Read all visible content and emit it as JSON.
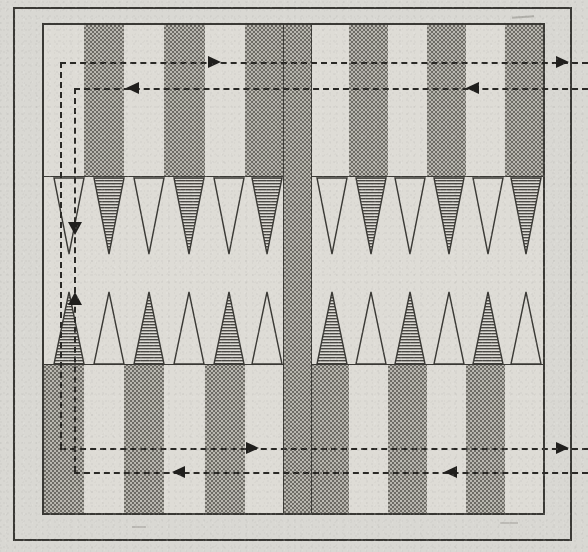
{
  "figure": {
    "kind": "backgammon-board-diagram",
    "background_color": "#d9d8d3",
    "board_color": "#dedcd6",
    "shade_color": "#6e6c66",
    "ink_color": "#3b3a36"
  },
  "geometry": {
    "canvas_width": 588,
    "canvas_height": 552,
    "outer_frame": {
      "x": 13,
      "y": 7,
      "width": 559,
      "height": 534
    },
    "board": {
      "x": 42,
      "y": 23,
      "width": 503,
      "height": 492
    },
    "bar": {
      "x": 281,
      "y": 23,
      "width": 27,
      "height": 492
    },
    "upper_quadrant": {
      "y": 23,
      "height": 152
    },
    "middle_band": {
      "y": 175,
      "height": 187
    },
    "lower_quadrant": {
      "y": 362,
      "height": 153
    },
    "point_count": 24,
    "points_per_quadrant": 6
  },
  "quadrants": [
    {
      "name": "top-left",
      "x": 42,
      "width": 239,
      "column_fills": [
        "light",
        "dark",
        "light",
        "dark",
        "light",
        "dark"
      ]
    },
    {
      "name": "top-right",
      "x": 308,
      "width": 237,
      "column_fills": [
        "light",
        "dark",
        "light",
        "dark",
        "light",
        "dark"
      ]
    },
    {
      "name": "bottom-left",
      "x": 42,
      "width": 239,
      "column_fills": [
        "dark",
        "light",
        "dark",
        "light",
        "dark",
        "light"
      ]
    },
    {
      "name": "bottom-right",
      "x": 308,
      "width": 237,
      "column_fills": [
        "dark",
        "light",
        "dark",
        "light",
        "dark",
        "light"
      ]
    }
  ],
  "points": {
    "top_left": {
      "direction": "down",
      "fills": [
        "open",
        "hatched",
        "open",
        "hatched",
        "open",
        "hatched"
      ]
    },
    "top_right": {
      "direction": "down",
      "fills": [
        "open",
        "hatched",
        "open",
        "hatched",
        "open",
        "hatched"
      ]
    },
    "bottom_left": {
      "direction": "up",
      "fills": [
        "hatched",
        "open",
        "hatched",
        "open",
        "hatched",
        "open"
      ]
    },
    "bottom_right": {
      "direction": "up",
      "fills": [
        "hatched",
        "open",
        "hatched",
        "open",
        "hatched",
        "open"
      ]
    }
  },
  "routes": [
    {
      "id": "route-player-one",
      "label": "Player one movement path",
      "style": "dashed",
      "segments": [
        {
          "type": "h",
          "x1": 60,
          "x2": 588,
          "y": 62,
          "arrow": "right",
          "arrow_x": 214
        },
        {
          "type": "h",
          "x1": 540,
          "x2": 588,
          "y": 62,
          "arrow": "right",
          "arrow_x": 560
        },
        {
          "type": "v",
          "x": 60,
          "y1": 62,
          "y2": 468
        },
        {
          "type": "h",
          "x1": 60,
          "x2": 588,
          "y": 448,
          "arrow": "right",
          "arrow_x": 252
        },
        {
          "type": "h",
          "x1": 500,
          "x2": 588,
          "y": 448,
          "arrow": "right",
          "arrow_x": 560
        }
      ]
    },
    {
      "id": "route-player-two",
      "label": "Player two movement path",
      "style": "dashed",
      "segments": [
        {
          "type": "h",
          "x1": 74,
          "x2": 588,
          "y": 88,
          "arrow": "left",
          "arrow_x": 132
        },
        {
          "type": "h",
          "x1": 440,
          "x2": 540,
          "y": 88,
          "arrow": "left",
          "arrow_x": 472
        },
        {
          "type": "v",
          "x": 74,
          "y1": 88,
          "y2": 240,
          "arrow": "down",
          "arrow_y": 226
        },
        {
          "type": "v",
          "x": 74,
          "y1": 240,
          "y2": 300,
          "arrow": "up",
          "arrow_y": 300
        },
        {
          "type": "v",
          "x": 74,
          "y1": 300,
          "y2": 472
        },
        {
          "type": "h",
          "x1": 74,
          "x2": 588,
          "y": 472,
          "arrow": "left",
          "arrow_x": 178
        },
        {
          "type": "h",
          "x1": 420,
          "x2": 540,
          "y": 472,
          "arrow": "left",
          "arrow_x": 450
        }
      ]
    }
  ]
}
